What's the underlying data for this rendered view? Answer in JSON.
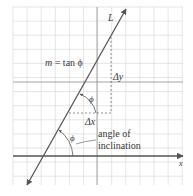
{
  "figure": {
    "width": 193,
    "height": 196,
    "background": "#ffffff"
  },
  "grid": {
    "x0": 13,
    "y0": 7,
    "x1": 183,
    "y1": 185,
    "cell": 14.1,
    "minor_color": "#d4d4d4",
    "major_color": "#9a9a9a",
    "major_vertical_x": [
      97
    ],
    "major_horizontal_y": [
      82
    ]
  },
  "axis": {
    "y": 156,
    "x_start": 13,
    "x_end": 183,
    "color": "#555555",
    "label": "x"
  },
  "line": {
    "label": "L",
    "x1": 27,
    "y1": 185,
    "x2": 126,
    "y2": 9,
    "color": "#555555"
  },
  "labels": {
    "slope_formula": "m = tan ϕ",
    "slope_m": "m",
    "slope_rest": " = tan ϕ",
    "delta_y": "Δy",
    "delta_x": "Δx",
    "phi_upper": "ϕ",
    "phi_lower": "ϕ",
    "angle_line1": "angle of",
    "angle_line2": "inclination",
    "axis_x": "x",
    "line_L": "L"
  },
  "dashed": {
    "vertical": {
      "x": 111,
      "y1": 37,
      "y2": 113
    },
    "horizontal": {
      "y": 113,
      "x1": 69,
      "x2": 111
    },
    "color": "#777777"
  }
}
